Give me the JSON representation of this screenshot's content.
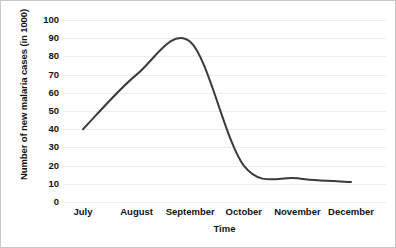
{
  "chart_data": {
    "type": "line",
    "title": "",
    "xlabel": "Time",
    "ylabel": "Number of new malaria cases (in 1000)",
    "categories": [
      "July",
      "August",
      "September",
      "October",
      "November",
      "December"
    ],
    "series": [
      {
        "name": "New malaria cases",
        "values": [
          40,
          70,
          88,
          20,
          13,
          11
        ],
        "color": "#3b3b3b"
      }
    ],
    "ylim": [
      0,
      100
    ],
    "yticks": [
      0,
      10,
      20,
      30,
      40,
      50,
      60,
      70,
      80,
      90,
      100
    ],
    "ytick_labels": [
      "0",
      "10",
      "20",
      "30",
      "40",
      "50",
      "60",
      "70",
      "80",
      "90",
      "100"
    ],
    "grid": true,
    "grid_axis": "y",
    "grid_color": "#ededed",
    "legend": false,
    "markers": false,
    "smooth": true,
    "line_width": 2,
    "peak": {
      "category": "September",
      "value": 88
    },
    "annotations": []
  }
}
